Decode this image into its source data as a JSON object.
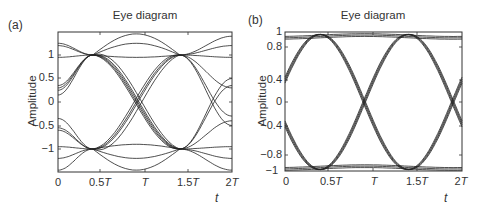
{
  "panels": [
    {
      "label": "(a)",
      "title": "Eye diagram",
      "ylabel": "Amplitude",
      "xlabel": "t",
      "yticks": [
        "1",
        "0.5",
        "0",
        "−0.5",
        "−1"
      ],
      "xticks": [
        {
          "num": "0",
          "sym": ""
        },
        {
          "num": "0.5",
          "sym": "T"
        },
        {
          "num": "",
          "sym": "T"
        },
        {
          "num": "1.5",
          "sym": "T"
        },
        {
          "num": "2",
          "sym": "T"
        }
      ]
    },
    {
      "label": "(b)",
      "title": "Eye diagram",
      "ylabel": "Amplitude",
      "xlabel": "t",
      "yticks": [
        "1",
        "0.8",
        "0.4",
        "0",
        "−0.4",
        "−0.8",
        "−1"
      ],
      "xticks": [
        {
          "num": "0",
          "sym": ""
        },
        {
          "num": "0.5",
          "sym": "T"
        },
        {
          "num": "",
          "sym": "T"
        },
        {
          "num": "1.5",
          "sym": "T"
        },
        {
          "num": "2",
          "sym": "T"
        }
      ]
    }
  ],
  "chart_data": [
    {
      "type": "line",
      "title": "Eye diagram",
      "panel": "(a)",
      "xlabel": "t",
      "ylabel": "Amplitude",
      "x_ticks": [
        "0",
        "0.5T",
        "T",
        "1.5T",
        "2T"
      ],
      "y_ticks": [
        1,
        0.5,
        0,
        -0.5,
        -1
      ],
      "xlim": [
        0,
        2
      ],
      "ylim": [
        -1.45,
        1.45
      ],
      "grid": false,
      "description": "Overlaid signal traces with intersymbol interference; crossings converge at amplitude ±1 near t≈0.4T and t≈1.4T; eye crossings near t≈0.9T and t≈1.9T; trace overshoot up to about ±1.4",
      "convergence_points": [
        {
          "t": 0.4,
          "y": 1
        },
        {
          "t": 0.4,
          "y": -1
        },
        {
          "t": 1.4,
          "y": 1
        },
        {
          "t": 1.4,
          "y": -1
        }
      ]
    },
    {
      "type": "line",
      "title": "Eye diagram",
      "panel": "(b)",
      "xlabel": "t",
      "ylabel": "Amplitude",
      "x_ticks": [
        "0",
        "0.5T",
        "T",
        "1.5T",
        "2T"
      ],
      "y_ticks": [
        1,
        0.8,
        0.4,
        0,
        -0.4,
        -0.8,
        -1
      ],
      "xlim": [
        0,
        2
      ],
      "ylim": [
        -1,
        1
      ],
      "grid": false,
      "description": "Clean open eye; traces transition between ±0.96 levels with crossings at 0 near t≈0.9T and t≈1.9T; traces start at ±0.35 at t=0",
      "convergence_points": [
        {
          "t": 0.4,
          "y": 1
        },
        {
          "t": 0.4,
          "y": -1
        },
        {
          "t": 1.4,
          "y": 1
        },
        {
          "t": 1.4,
          "y": -1
        },
        {
          "t": 0.9,
          "y": 0
        },
        {
          "t": 1.9,
          "y": 0
        }
      ]
    }
  ]
}
